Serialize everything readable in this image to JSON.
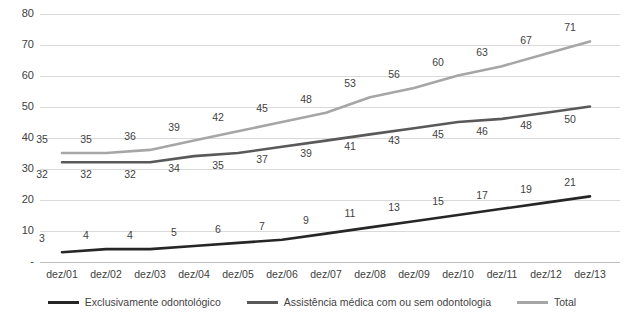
{
  "chart_data": {
    "type": "line",
    "title": "",
    "subtitle": "",
    "xlabel": "",
    "ylabel": "",
    "ylim": [
      0,
      80
    ],
    "ytick_values": [
      0,
      10,
      20,
      30,
      40,
      50,
      60,
      70,
      80
    ],
    "ytick_labels": [
      "-",
      "10",
      "20",
      "30",
      "40",
      "50",
      "60",
      "70",
      "80"
    ],
    "grid": true,
    "legend_position": "bottom",
    "categories": [
      "dez/01",
      "dez/02",
      "dez/03",
      "dez/04",
      "dez/05",
      "dez/06",
      "dez/07",
      "dez/08",
      "dez/09",
      "dez/10",
      "dez/11",
      "dez/12",
      "dez/13"
    ],
    "series": [
      {
        "name": "Exclusivamente odontológico",
        "color": "#262626",
        "values": [
          3,
          4,
          4,
          5,
          6,
          7,
          9,
          11,
          13,
          15,
          17,
          19,
          21
        ],
        "labels": [
          "3",
          "4",
          "4",
          "5",
          "6",
          "7",
          "9",
          "11",
          "13",
          "15",
          "17",
          "19",
          "21"
        ],
        "label_position": "above"
      },
      {
        "name": "Assistência médica com ou sem odontologia",
        "color": "#595959",
        "values": [
          32,
          32,
          32,
          34,
          35,
          37,
          39,
          41,
          43,
          45,
          46,
          48,
          50
        ],
        "labels": [
          "32",
          "32",
          "32",
          "34",
          "35",
          "37",
          "39",
          "41",
          "43",
          "45",
          "46",
          "48",
          "50"
        ],
        "label_position": "below"
      },
      {
        "name": "Total",
        "color": "#a6a6a6",
        "values": [
          35,
          35,
          36,
          39,
          42,
          45,
          48,
          53,
          56,
          60,
          63,
          67,
          71
        ],
        "labels": [
          "35",
          "35",
          "36",
          "39",
          "42",
          "45",
          "48",
          "53",
          "56",
          "60",
          "63",
          "67",
          "71"
        ],
        "label_position": "above"
      }
    ]
  }
}
